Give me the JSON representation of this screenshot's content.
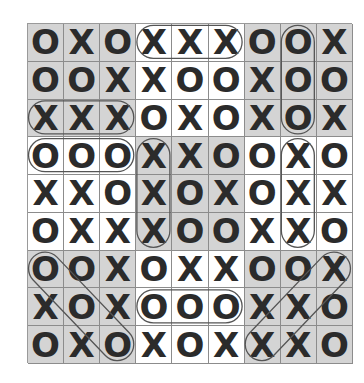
{
  "board": {
    "rows": 9,
    "cols": 9,
    "cells": [
      [
        "O",
        "X",
        "O",
        "X",
        "X",
        "X",
        "O",
        "O",
        "X"
      ],
      [
        "O",
        "O",
        "X",
        "X",
        "O",
        "O",
        "X",
        "O",
        "O"
      ],
      [
        "X",
        "X",
        "X",
        "O",
        "X",
        "O",
        "X",
        "O",
        "X"
      ],
      [
        "O",
        "O",
        "O",
        "X",
        "X",
        "O",
        "O",
        "X",
        "O"
      ],
      [
        "X",
        "X",
        "O",
        "X",
        "O",
        "X",
        "O",
        "X",
        "X"
      ],
      [
        "O",
        "X",
        "X",
        "X",
        "O",
        "O",
        "X",
        "X",
        "O"
      ],
      [
        "O",
        "O",
        "X",
        "O",
        "X",
        "X",
        "O",
        "O",
        "X"
      ],
      [
        "X",
        "O",
        "X",
        "O",
        "O",
        "O",
        "X",
        "X",
        "O"
      ],
      [
        "O",
        "X",
        "O",
        "X",
        "O",
        "X",
        "X",
        "X",
        "O"
      ]
    ],
    "shaded_blocks": [
      [
        true,
        false,
        true
      ],
      [
        false,
        true,
        false
      ],
      [
        true,
        false,
        true
      ]
    ],
    "highlighted_lines": [
      {
        "symbol": "X",
        "from": [
          0,
          3
        ],
        "to": [
          0,
          5
        ],
        "direction": "horizontal"
      },
      {
        "symbol": "O",
        "from": [
          0,
          7
        ],
        "to": [
          2,
          7
        ],
        "direction": "vertical"
      },
      {
        "symbol": "X",
        "from": [
          2,
          0
        ],
        "to": [
          2,
          2
        ],
        "direction": "horizontal"
      },
      {
        "symbol": "O",
        "from": [
          3,
          0
        ],
        "to": [
          3,
          2
        ],
        "direction": "horizontal"
      },
      {
        "symbol": "X",
        "from": [
          3,
          3
        ],
        "to": [
          5,
          3
        ],
        "direction": "vertical"
      },
      {
        "symbol": "X",
        "from": [
          3,
          7
        ],
        "to": [
          5,
          7
        ],
        "direction": "vertical"
      },
      {
        "symbol": "O",
        "from": [
          6,
          0
        ],
        "to": [
          8,
          2
        ],
        "direction": "diagonal"
      },
      {
        "symbol": "O",
        "from": [
          7,
          3
        ],
        "to": [
          7,
          5
        ],
        "direction": "horizontal"
      },
      {
        "symbol": "X",
        "from": [
          6,
          8
        ],
        "to": [
          8,
          6
        ],
        "direction": "anti-diagonal"
      }
    ]
  },
  "colors": {
    "shaded": "#d4d4d4",
    "plain": "#ffffff",
    "mark": "#2b2b2b",
    "grid_line": "#8c8c8c",
    "highlight_outline": "#555555"
  }
}
